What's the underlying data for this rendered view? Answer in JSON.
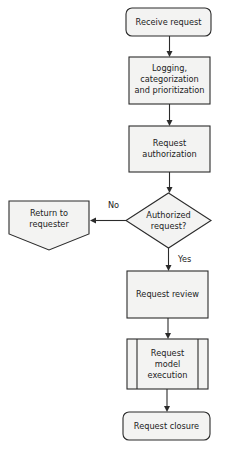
{
  "diagram": {
    "type": "flowchart",
    "nodes": {
      "receive": {
        "label": "Receive request",
        "shape": "terminator"
      },
      "logging": {
        "line1": "Logging,",
        "line2": "categorization",
        "line3": "and prioritization",
        "shape": "process"
      },
      "authorization": {
        "line1": "Request",
        "line2": "authorization",
        "shape": "process"
      },
      "decision": {
        "line1": "Authorized",
        "line2": "request?",
        "shape": "decision"
      },
      "return": {
        "line1": "Return to",
        "line2": "requester",
        "shape": "off-page-connector"
      },
      "review": {
        "label": "Request review",
        "shape": "process"
      },
      "model": {
        "line1": "Request",
        "line2": "model",
        "line3": "execution",
        "shape": "predefined-process"
      },
      "closure": {
        "label": "Request closure",
        "shape": "terminator"
      }
    },
    "edges": {
      "no_label": "No",
      "yes_label": "Yes"
    },
    "colors": {
      "fill": "#f3f3f2",
      "stroke": "#2b2b2b",
      "text": "#222222"
    }
  }
}
